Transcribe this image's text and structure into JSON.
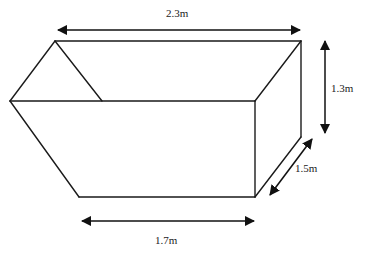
{
  "diagram": {
    "type": "skip-shaped prism (trapezoidal cross-section)",
    "colors": {
      "line": "#1a1a1a",
      "background": "#ffffff"
    },
    "dimensions": {
      "top_length": {
        "label": "2.3m",
        "value": 2.3,
        "unit": "m"
      },
      "height": {
        "label": "1.3m",
        "value": 1.3,
        "unit": "m"
      },
      "depth": {
        "label": "1.5m",
        "value": 1.5,
        "unit": "m"
      },
      "bottom_length": {
        "label": "1.7m",
        "value": 1.7,
        "unit": "m"
      }
    }
  }
}
